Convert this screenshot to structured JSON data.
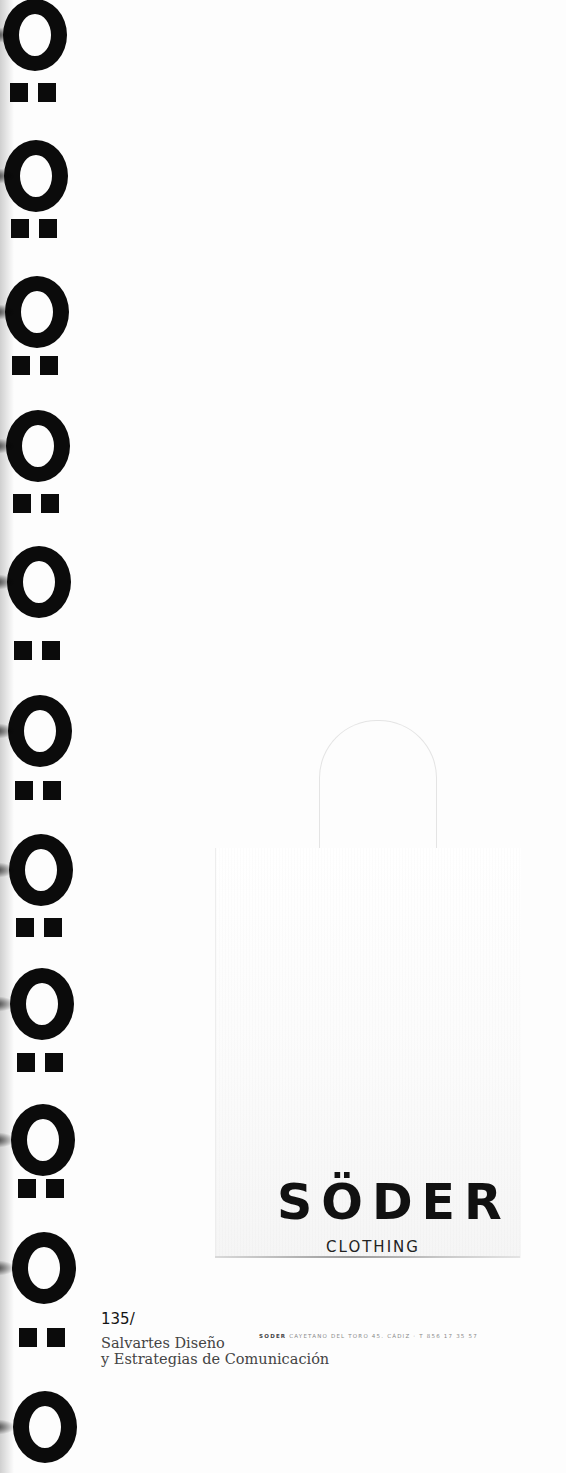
{
  "pattern": {
    "motif": "ring-and-dieresis",
    "color": "#0b0b0b",
    "rings_y": [
      35,
      176,
      312,
      446,
      582,
      731,
      870,
      1004,
      1140,
      1268,
      1427
    ],
    "dots_y": [
      92,
      228,
      365,
      503,
      650,
      790,
      927,
      1062,
      1188,
      1337
    ]
  },
  "bag": {
    "brand": "SÖDER",
    "brand_base": "SODER",
    "subtitle": "CLOTHING",
    "address_brand": "SODER",
    "address_text": "CAYETANO DEL TORO 45. CÁDIZ · T 856 17 35 57"
  },
  "caption": {
    "page_number": "135/",
    "studio_line1": "Salvartes Diseño",
    "studio_line2": "y Estrategias de Comunicación"
  }
}
